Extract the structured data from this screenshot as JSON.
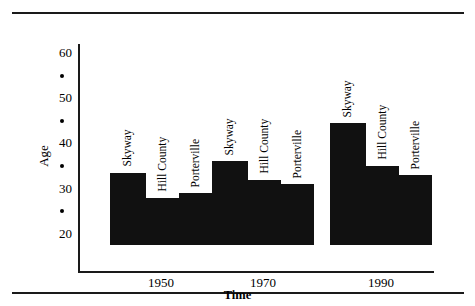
{
  "chart_data": {
    "type": "bar",
    "title": "",
    "xlabel": "Time",
    "ylabel": "Age",
    "categories": [
      "1950",
      "1970",
      "1990"
    ],
    "series": [
      {
        "name": "Skyway",
        "values": [
          33.5,
          36.0,
          44.5
        ]
      },
      {
        "name": "Hill County",
        "values": [
          28.0,
          32.0,
          35.0
        ]
      },
      {
        "name": "Porterville",
        "values": [
          29.0,
          31.0,
          33.0
        ]
      }
    ],
    "ylim": [
      17.5,
      62
    ],
    "y_major_ticks": [
      20,
      30,
      40,
      50,
      60
    ],
    "y_minor_tick_marker": "dot",
    "y_minor_ticks": [
      25,
      35,
      45,
      55
    ],
    "grid": false,
    "legend": "inline-rotated-labels",
    "bar_color": "#111111",
    "axis_color": "#1a1a1a",
    "background": "#ffffff"
  },
  "axes": {
    "y_title": "Age",
    "x_title": "Time",
    "y_ticks": [
      "60",
      "50",
      "40",
      "30",
      "20"
    ],
    "x_ticks": [
      "1950",
      "1970",
      "1990"
    ]
  },
  "groups": [
    {
      "year": "1950",
      "bars": [
        {
          "name": "Skyway",
          "value": 33.5
        },
        {
          "name": "Hill County",
          "value": 28.0
        },
        {
          "name": "Porterville",
          "value": 29.0
        }
      ]
    },
    {
      "year": "1970",
      "bars": [
        {
          "name": "Skyway",
          "value": 36.0
        },
        {
          "name": "Hill County",
          "value": 32.0
        },
        {
          "name": "Porterville",
          "value": 31.0
        }
      ]
    },
    {
      "year": "1990",
      "bars": [
        {
          "name": "Skyway",
          "value": 44.5
        },
        {
          "name": "Hill County",
          "value": 35.0
        },
        {
          "name": "Porterville",
          "value": 33.0
        }
      ]
    }
  ]
}
